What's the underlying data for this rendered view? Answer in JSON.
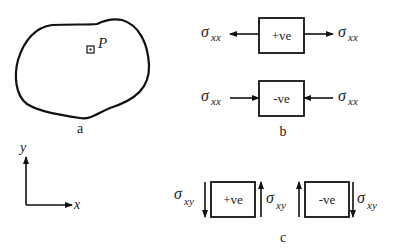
{
  "figure": {
    "panel_a": {
      "caption": "a",
      "point_label": "P"
    },
    "panel_b": {
      "caption": "b",
      "tension_box_label": "+ve",
      "compression_box_label": "-ve",
      "stress_symbol": "σ",
      "stress_subscript": "xx"
    },
    "panel_c": {
      "caption": "c",
      "positive_box_label": "+ve",
      "negative_box_label": "-ve",
      "stress_symbol": "σ",
      "stress_subscript": "xy"
    },
    "axes": {
      "x_label": "x",
      "y_label": "y"
    },
    "colors": {
      "stroke": "#111111",
      "text": "#222222",
      "background": "#ffffff"
    }
  }
}
